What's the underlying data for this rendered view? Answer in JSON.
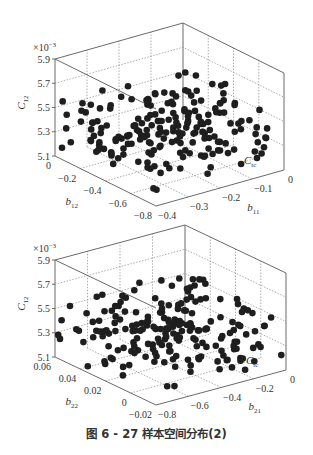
{
  "caption": "图 6 - 27    样本空间分布(2)",
  "chart_data": [
    {
      "type": "scatter",
      "subtype": "3d-scatter",
      "title": "",
      "zlabel": "C12",
      "zscale_label": "×10⁻³",
      "z_ticks": [
        "5.1",
        "5.3",
        "5.5",
        "5.7",
        "5.9"
      ],
      "zlim": [
        5.1,
        5.9
      ],
      "xlabel": "b12",
      "x_ticks": [
        "0",
        "-0.2",
        "-0.4",
        "-0.6",
        "-0.8"
      ],
      "xlim": [
        -0.8,
        0
      ],
      "ylabel": "b11",
      "y_ticks": [
        "-0.4",
        "-0.3",
        "-0.2",
        "-0.1",
        "0"
      ],
      "ylim": [
        -0.4,
        0
      ],
      "corner_label": "C_tc",
      "grid": true,
      "point_count_approx": 200,
      "description": "Approximately 200 uniformly scattered sample points filling the design space"
    },
    {
      "type": "scatter",
      "subtype": "3d-scatter",
      "title": "",
      "zlabel": "C12",
      "zscale_label": "×10⁻³",
      "z_ticks": [
        "5.1",
        "5.3",
        "5.5",
        "5.7",
        "5.9"
      ],
      "zlim": [
        5.1,
        5.9
      ],
      "xlabel": "b22",
      "x_ticks": [
        "0.06",
        "0.04",
        "0.02",
        "0",
        "-0.02"
      ],
      "xlim": [
        -0.02,
        0.06
      ],
      "ylabel": "b21",
      "y_ticks": [
        "-0.8",
        "-0.6",
        "-0.4",
        "-0.2",
        "0"
      ],
      "ylim": [
        -0.8,
        0
      ],
      "corner_label": "C_tc",
      "grid": true,
      "point_count_approx": 200,
      "description": "Approximately 200 uniformly scattered sample points filling the design space"
    }
  ],
  "charts": [
    {
      "scale": "×10",
      "scale_exp": "−3",
      "z_ticks": [
        "5.9",
        "5.7",
        "5.5",
        "5.3",
        "5.1"
      ],
      "zlabel": "C",
      "zlabel_sub": "12",
      "x_ticks": [
        "0",
        "−0.2",
        "−0.4",
        "−0.6",
        "−0.8"
      ],
      "xlabel": "b",
      "xlabel_sub": "12",
      "y_ticks": [
        "−0.4",
        "−0.3",
        "−0.2",
        "−0.1",
        "0"
      ],
      "ylabel": "b",
      "ylabel_sub": "11",
      "corner": "C",
      "corner_sub": "tc"
    },
    {
      "scale": "×10",
      "scale_exp": "−3",
      "z_ticks": [
        "5.9",
        "5.7",
        "5.5",
        "5.3",
        "5.1"
      ],
      "zlabel": "C",
      "zlabel_sub": "12",
      "x_ticks": [
        "0.06",
        "0.04",
        "0.02",
        "0",
        "−0.02"
      ],
      "xlabel": "b",
      "xlabel_sub": "22",
      "y_ticks": [
        "−0.8",
        "−0.6",
        "−0.4",
        "−0.2",
        "0"
      ],
      "ylabel": "b",
      "ylabel_sub": "21",
      "corner": "C",
      "corner_sub": "tc"
    }
  ]
}
